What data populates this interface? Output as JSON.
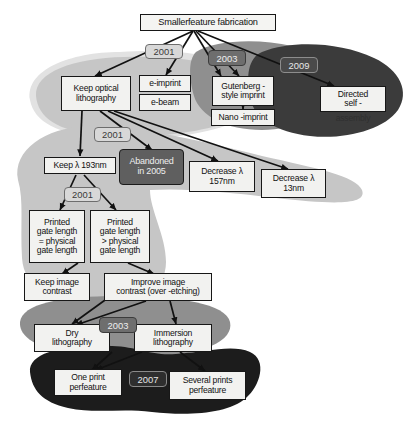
{
  "diagram": {
    "root": {
      "id": "root",
      "label": "Smallerfeature fabrication"
    },
    "nodes": [
      {
        "id": "keep-optical",
        "label": "Keep optical\nlithography",
        "style": "plain"
      },
      {
        "id": "e-imprint",
        "label": "e-imprint",
        "style": "plain"
      },
      {
        "id": "e-beam",
        "label": "e-beam",
        "style": "plain"
      },
      {
        "id": "gutenberg",
        "label": "Gutenberg -\nstyle imprint",
        "style": "plain"
      },
      {
        "id": "nano-imprint",
        "label": "Nano -imprint",
        "style": "plain"
      },
      {
        "id": "directed-self",
        "label": "Directed\nself -",
        "style": "plain"
      },
      {
        "id": "directed-self-tail",
        "label": "assembly",
        "style": "ghost"
      },
      {
        "id": "keep-lambda",
        "label": "Keep  λ 193nm",
        "style": "plain"
      },
      {
        "id": "abandoned",
        "label": "Abandoned\nin 2005",
        "style": "dark"
      },
      {
        "id": "decrease-157",
        "label": "Decrease  λ\n157nm",
        "style": "plain"
      },
      {
        "id": "decrease-13",
        "label": "Decrease  λ\n13nm",
        "style": "plain"
      },
      {
        "id": "printed-equal",
        "label": "Printed\ngate length\n= physical\ngate length",
        "style": "plain"
      },
      {
        "id": "printed-greater",
        "label": "Printed\ngate length\n> physical\ngate length",
        "style": "plain"
      },
      {
        "id": "keep-contrast",
        "label": "Keep image\ncontrast",
        "style": "plain"
      },
      {
        "id": "improve-contrast",
        "label": "Improve image\ncontrast (over -etching)",
        "style": "plain"
      },
      {
        "id": "dry-litho",
        "label": "Dry\nlithography",
        "style": "plain"
      },
      {
        "id": "immersion-litho",
        "label": "Immersion\nlithography",
        "style": "plain"
      },
      {
        "id": "one-print",
        "label": "One print\nperfeature",
        "style": "plain"
      },
      {
        "id": "several-prints",
        "label": "Several prints\nperfeature",
        "style": "plain"
      }
    ],
    "year_labels": [
      {
        "id": "year-2001-a",
        "label": "2001",
        "tone": "light"
      },
      {
        "id": "year-2003-a",
        "label": "2003",
        "tone": "medium"
      },
      {
        "id": "year-2009",
        "label": "2009",
        "tone": "dark"
      },
      {
        "id": "year-2001-b",
        "label": "2001",
        "tone": "light"
      },
      {
        "id": "year-2001-c",
        "label": "2001",
        "tone": "light"
      },
      {
        "id": "year-2003-b",
        "label": "2003",
        "tone": "medium"
      },
      {
        "id": "year-2007",
        "label": "2007",
        "tone": "very-dark"
      }
    ],
    "regions": [
      {
        "id": "region-light",
        "color": "#c6c6c6"
      },
      {
        "id": "region-light-2",
        "color": "#c6c6c6"
      },
      {
        "id": "region-medium",
        "color": "#8f8f8f"
      },
      {
        "id": "region-dark",
        "color": "#3b3b3b"
      },
      {
        "id": "region-very-dark",
        "color": "#1c1c1c"
      }
    ],
    "colors": {
      "background": "#ffffff",
      "node_fill": "#f2f2f0",
      "node_border": "#171717",
      "edge": "#111111",
      "region_light": "#c6c6c6",
      "region_medium": "#8f8f8f",
      "region_dark": "#3b3b3b",
      "region_very_dark": "#1c1c1c"
    }
  }
}
